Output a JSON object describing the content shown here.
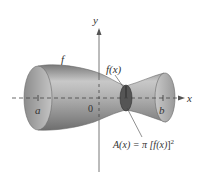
{
  "figure": {
    "axes": {
      "x_label": "x",
      "y_label": "y",
      "origin_label": "0"
    },
    "limits": {
      "a_label": "a",
      "b_label": "b"
    },
    "curve_label": "f",
    "radius_label": "f(x)",
    "area_formula": {
      "lhs": "A(x) = π [",
      "inner": "f(x)",
      "rhs": "]",
      "exponent": "2"
    },
    "colors": {
      "solid_light": "#d9d9d9",
      "solid_mid": "#a8a8a8",
      "solid_dark": "#6e6e6e",
      "cross_section": "#5a5a5a",
      "axis": "#555555",
      "text": "#333333"
    }
  }
}
